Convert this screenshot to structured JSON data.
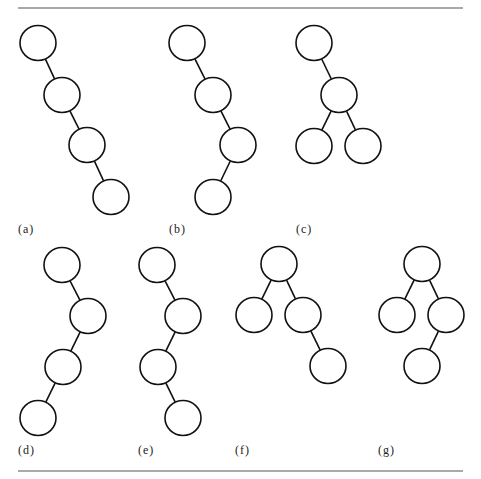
{
  "figure": {
    "radius": 18,
    "rules": [
      {
        "x1": 18,
        "y1": 8,
        "x2": 463,
        "y2": 8
      },
      {
        "x1": 18,
        "y1": 471,
        "x2": 463,
        "y2": 471
      }
    ],
    "trees": [
      {
        "label": "(a)",
        "label_x": 18,
        "label_y": 233,
        "nodes": [
          [
            38,
            43
          ],
          [
            62,
            95
          ],
          [
            87,
            145
          ],
          [
            111,
            197
          ]
        ],
        "edges": [
          [
            0,
            1
          ],
          [
            1,
            2
          ],
          [
            2,
            3
          ]
        ]
      },
      {
        "label": "(b)",
        "label_x": 169,
        "label_y": 233,
        "nodes": [
          [
            187,
            43
          ],
          [
            213,
            95
          ],
          [
            238,
            145
          ],
          [
            213,
            197
          ]
        ],
        "edges": [
          [
            0,
            1
          ],
          [
            1,
            2
          ],
          [
            2,
            3
          ]
        ]
      },
      {
        "label": "(c)",
        "label_x": 296,
        "label_y": 233,
        "nodes": [
          [
            314,
            43
          ],
          [
            339,
            95
          ],
          [
            314,
            146
          ],
          [
            363,
            146
          ]
        ],
        "edges": [
          [
            0,
            1
          ],
          [
            1,
            2
          ],
          [
            1,
            3
          ]
        ]
      },
      {
        "label": "(d)",
        "label_x": 18,
        "label_y": 454,
        "nodes": [
          [
            62,
            265
          ],
          [
            88,
            316
          ],
          [
            63,
            367
          ],
          [
            38,
            418
          ]
        ],
        "edges": [
          [
            0,
            1
          ],
          [
            1,
            2
          ],
          [
            2,
            3
          ]
        ]
      },
      {
        "label": "(e)",
        "label_x": 138,
        "label_y": 454,
        "nodes": [
          [
            157,
            265
          ],
          [
            183,
            316
          ],
          [
            158,
            367
          ],
          [
            183,
            418
          ]
        ],
        "edges": [
          [
            0,
            1
          ],
          [
            1,
            2
          ],
          [
            2,
            3
          ]
        ]
      },
      {
        "label": "(f)",
        "label_x": 235,
        "label_y": 454,
        "nodes": [
          [
            279,
            264
          ],
          [
            254,
            315
          ],
          [
            303,
            315
          ],
          [
            328,
            366
          ]
        ],
        "edges": [
          [
            0,
            1
          ],
          [
            0,
            2
          ],
          [
            2,
            3
          ]
        ]
      },
      {
        "label": "(g)",
        "label_x": 378,
        "label_y": 454,
        "nodes": [
          [
            422,
            264
          ],
          [
            397,
            315
          ],
          [
            446,
            315
          ],
          [
            422,
            366
          ]
        ],
        "edges": [
          [
            0,
            1
          ],
          [
            0,
            2
          ],
          [
            2,
            3
          ]
        ]
      }
    ]
  }
}
